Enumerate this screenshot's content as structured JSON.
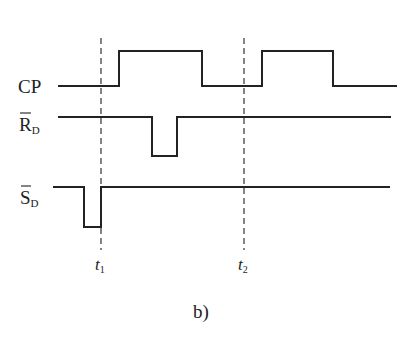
{
  "diagram": {
    "type": "timing-diagram",
    "caption": "b)",
    "signals": [
      {
        "name": "CP",
        "label_main": "CP",
        "label_sub": "",
        "overbar": false
      },
      {
        "name": "RD",
        "label_main": "R",
        "label_sub": "D",
        "overbar": true
      },
      {
        "name": "SD",
        "label_main": "S",
        "label_sub": "D",
        "overbar": true
      }
    ],
    "time_markers": [
      {
        "label_main": "t",
        "label_sub": "1"
      },
      {
        "label_main": "t",
        "label_sub": "2"
      }
    ],
    "colors": {
      "line": "#222222",
      "background": "#ffffff"
    }
  }
}
